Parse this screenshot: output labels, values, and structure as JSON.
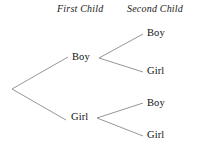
{
  "diagram": {
    "type": "probability-tree",
    "background_color": "#ffffff",
    "line_color": "#8a8a8a",
    "text_color": "#101010",
    "width": 202,
    "height": 153,
    "headers": [
      {
        "id": "first",
        "label": "First Child"
      },
      {
        "id": "second",
        "label": "Second Child"
      }
    ],
    "root": {
      "x": 12,
      "y": 89
    },
    "level1": [
      {
        "id": "boy",
        "label": "Boy",
        "x": 85,
        "y": 58,
        "branch_end_x": 68,
        "branch_vertex_x": 99
      },
      {
        "id": "girl",
        "label": "Girl",
        "x": 83,
        "y": 118,
        "branch_end_x": 66,
        "branch_vertex_x": 97
      }
    ],
    "level2": [
      {
        "id": "boy-boy",
        "label": "Boy",
        "parent": "boy",
        "x": 160,
        "y": 34,
        "branch_end_x": 143
      },
      {
        "id": "boy-girl",
        "label": "Girl",
        "parent": "boy",
        "x": 160,
        "y": 72,
        "branch_end_x": 143
      },
      {
        "id": "girl-boy",
        "label": "Boy",
        "parent": "girl",
        "x": 160,
        "y": 104,
        "branch_end_x": 143
      },
      {
        "id": "girl-girl",
        "label": "Girl",
        "parent": "girl",
        "x": 160,
        "y": 136,
        "branch_end_x": 143
      }
    ],
    "outcomes": [
      "Boy, Boy",
      "Boy, Girl",
      "Girl, Boy",
      "Girl, Girl"
    ]
  }
}
